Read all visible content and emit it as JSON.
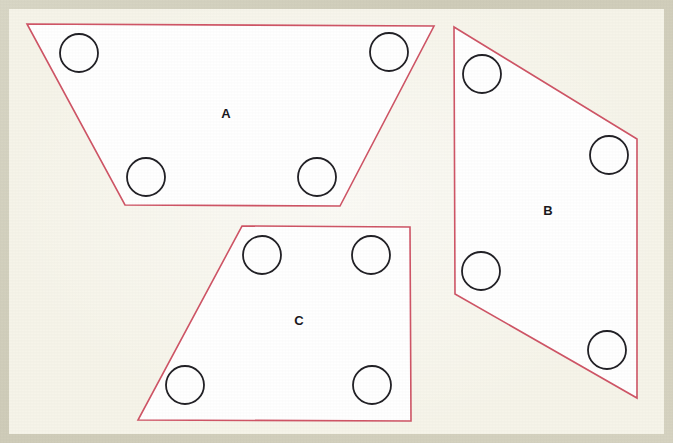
{
  "figure": {
    "canvas": {
      "width": 673,
      "height": 443
    },
    "colors": {
      "paper": "#f6f4e9",
      "page_border": "#d6d3c1",
      "shape_fill": "#ffffff",
      "shape_outline": "#cf5566",
      "hole_outline": "#222126",
      "label_text": "#1a191d"
    },
    "shapes": [
      {
        "label": "A",
        "kind": "trapezoid",
        "label_pos": {
          "x": 226,
          "y": 115
        },
        "points": "27,24 434,26 340,206 125,205",
        "holes": [
          {
            "cx": 79,
            "cy": 53,
            "r": 19
          },
          {
            "cx": 389,
            "cy": 52,
            "r": 19
          },
          {
            "cx": 146,
            "cy": 177,
            "r": 19
          },
          {
            "cx": 317,
            "cy": 177,
            "r": 19
          }
        ]
      },
      {
        "label": "B",
        "kind": "parallelogram",
        "label_pos": {
          "x": 548,
          "y": 212
        },
        "points": "454,27 637,139 637,398 455,294",
        "holes": [
          {
            "cx": 482,
            "cy": 74,
            "r": 19
          },
          {
            "cx": 609,
            "cy": 155,
            "r": 19
          },
          {
            "cx": 481,
            "cy": 271,
            "r": 19
          },
          {
            "cx": 607,
            "cy": 350,
            "r": 19
          }
        ]
      },
      {
        "label": "C",
        "kind": "trapezoid",
        "label_pos": {
          "x": 299,
          "y": 322
        },
        "points": "242,226 410,227 411,421 138,420",
        "holes": [
          {
            "cx": 262,
            "cy": 255,
            "r": 19
          },
          {
            "cx": 371,
            "cy": 255,
            "r": 19
          },
          {
            "cx": 185,
            "cy": 385,
            "r": 19
          },
          {
            "cx": 372,
            "cy": 385,
            "r": 19
          }
        ]
      }
    ]
  }
}
